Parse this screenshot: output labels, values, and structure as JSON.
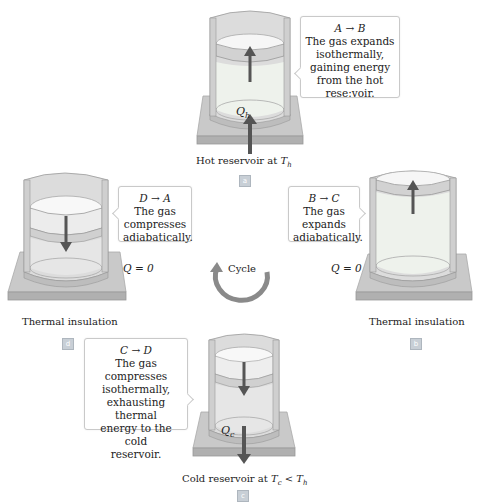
{
  "panels": {
    "a": {
      "badge": "a",
      "callout": {
        "title": "A → B",
        "lines": [
          "The gas expands",
          "isothermally,",
          "gaining energy",
          "from the hot",
          "rese:voir."
        ]
      },
      "heat_label": "Q",
      "heat_sub": "h",
      "caption_prefix": "Hot reservoir at ",
      "caption_var": "T",
      "caption_sub": "h",
      "piston_arrow": "up",
      "heat_arrow": "in"
    },
    "b": {
      "badge": "b",
      "callout": {
        "title": "B → C",
        "lines": [
          "The gas",
          "expands",
          "adiabatically."
        ]
      },
      "q_label": "Q = 0",
      "caption": "Thermal insulation",
      "piston_arrow": "up"
    },
    "c": {
      "badge": "c",
      "callout": {
        "title": "C → D",
        "lines": [
          "The gas",
          "compresses",
          "isothermally,",
          "exhausting thermal",
          "energy to the cold",
          "reservoir."
        ]
      },
      "heat_label": "Q",
      "heat_sub": "c",
      "caption_prefix": "Cold reservoir at ",
      "caption_var": "T",
      "caption_sub": "c",
      "caption_lt": " < ",
      "caption_var2": "T",
      "caption_sub2": "h",
      "piston_arrow": "down",
      "heat_arrow": "out"
    },
    "d": {
      "badge": "d",
      "callout": {
        "title": "D → A",
        "lines": [
          "The gas",
          "compresses",
          "adiabatically."
        ]
      },
      "q_label": "Q = 0",
      "caption": "Thermal insulation",
      "piston_arrow": "down"
    }
  },
  "cycle": {
    "label": "Cycle",
    "direction": "counterclockwise"
  },
  "colors": {
    "base_top": "#c6c6c6",
    "base_front": "#b2b2b2",
    "cylinder_wall": "#d9d9d9",
    "gas_fill": "#ececec",
    "piston": "#f5f5f5",
    "arrow": "#555555",
    "cycle_arrow": "#8a8a8a",
    "badge": "#c8cfd6"
  }
}
